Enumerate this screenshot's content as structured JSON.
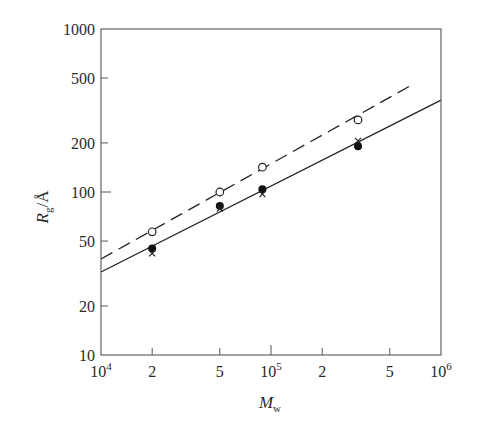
{
  "chart_data": {
    "type": "scatter",
    "title": "",
    "xlabel": "M_w",
    "ylabel": "R_g/Å",
    "xscale": "log",
    "yscale": "log",
    "xlim": [
      10000,
      1000000
    ],
    "ylim": [
      10,
      1000
    ],
    "grid": false,
    "legend": null,
    "x_ticks": [
      {
        "value": 10000,
        "label": "10",
        "sup": "4",
        "major": true
      },
      {
        "value": 20000,
        "label": "2",
        "sup": "",
        "major": false
      },
      {
        "value": 50000,
        "label": "5",
        "sup": "",
        "major": false
      },
      {
        "value": 100000,
        "label": "10",
        "sup": "5",
        "major": true
      },
      {
        "value": 200000,
        "label": "2",
        "sup": "",
        "major": false
      },
      {
        "value": 500000,
        "label": "5",
        "sup": "",
        "major": false
      },
      {
        "value": 1000000,
        "label": "10",
        "sup": "6",
        "major": true
      }
    ],
    "y_ticks": [
      {
        "value": 10,
        "label": "10",
        "major": true
      },
      {
        "value": 20,
        "label": "20",
        "major": false
      },
      {
        "value": 50,
        "label": "50",
        "major": false
      },
      {
        "value": 100,
        "label": "100",
        "major": true
      },
      {
        "value": 200,
        "label": "200",
        "major": false
      },
      {
        "value": 500,
        "label": "500",
        "major": false
      },
      {
        "value": 1000,
        "label": "1000",
        "major": true
      }
    ],
    "series": [
      {
        "name": "open circles",
        "marker": "open-circle",
        "x": [
          20000,
          50000,
          89000,
          325000
        ],
        "y": [
          57,
          100,
          142,
          277
        ]
      },
      {
        "name": "filled circles",
        "marker": "filled-circle",
        "x": [
          20000,
          50000,
          89000,
          325000
        ],
        "y": [
          45,
          82,
          104,
          191
        ]
      },
      {
        "name": "crosses",
        "marker": "cross",
        "x": [
          20000,
          50000,
          89000,
          325000
        ],
        "y": [
          42,
          79,
          97,
          206
        ]
      }
    ],
    "lines": [
      {
        "name": "dashed fit",
        "style": "dashed",
        "x": [
          10000,
          690000
        ],
        "y": [
          38.8,
          460
        ]
      },
      {
        "name": "solid fit",
        "style": "solid",
        "x": [
          10000,
          1000000
        ],
        "y": [
          32.3,
          366
        ]
      }
    ]
  },
  "labels": {
    "y_axis_main": "R",
    "y_axis_sub": "g",
    "y_axis_unit": "/Å",
    "x_axis_main": "M",
    "x_axis_sub": "w"
  }
}
